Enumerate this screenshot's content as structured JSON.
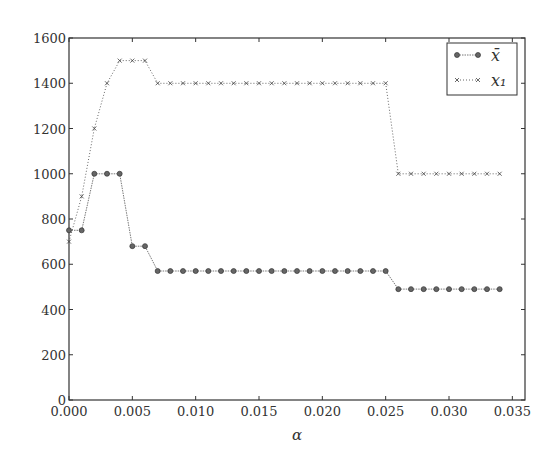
{
  "chart_data": {
    "type": "line",
    "title": "",
    "xlabel": "α",
    "ylabel": "",
    "xlim": [
      0.0,
      0.036
    ],
    "ylim": [
      0,
      1600
    ],
    "grid": false,
    "legend_position": "upper right",
    "x_ticks": [
      "0.000",
      "0.005",
      "0.010",
      "0.015",
      "0.020",
      "0.025",
      "0.030",
      "0.035"
    ],
    "y_ticks": [
      "0",
      "200",
      "400",
      "600",
      "800",
      "1000",
      "1200",
      "1400",
      "1600"
    ],
    "x": [
      0.0,
      0.001,
      0.002,
      0.003,
      0.004,
      0.005,
      0.006,
      0.007,
      0.008,
      0.009,
      0.01,
      0.011,
      0.012,
      0.013,
      0.014,
      0.015,
      0.016,
      0.017,
      0.018,
      0.019,
      0.02,
      0.021,
      0.022,
      0.023,
      0.024,
      0.025,
      0.026,
      0.027,
      0.028,
      0.029,
      0.03,
      0.031,
      0.032,
      0.033,
      0.034
    ],
    "series": [
      {
        "name": "x̄",
        "marker": "circle",
        "line": "solid-thin",
        "values": [
          750,
          750,
          1000,
          1000,
          1000,
          680,
          680,
          570,
          570,
          570,
          570,
          570,
          570,
          570,
          570,
          570,
          570,
          570,
          570,
          570,
          570,
          570,
          570,
          570,
          570,
          570,
          490,
          490,
          490,
          490,
          490,
          490,
          490,
          490,
          490
        ]
      },
      {
        "name": "x₁",
        "marker": "x",
        "line": "dotted",
        "values": [
          700,
          900,
          1200,
          1400,
          1500,
          1500,
          1500,
          1400,
          1400,
          1400,
          1400,
          1400,
          1400,
          1400,
          1400,
          1400,
          1400,
          1400,
          1400,
          1400,
          1400,
          1400,
          1400,
          1400,
          1400,
          1400,
          1000,
          1000,
          1000,
          1000,
          1000,
          1000,
          1000,
          1000,
          1000
        ]
      }
    ]
  },
  "colors": {
    "axis": "#333333",
    "series": "#555555"
  }
}
